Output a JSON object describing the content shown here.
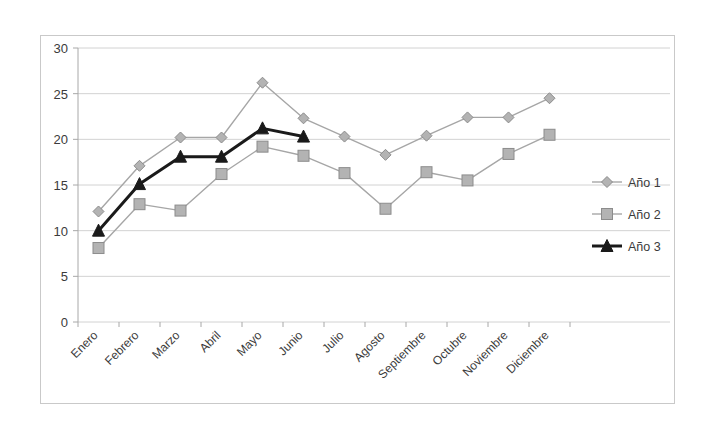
{
  "chart_data": {
    "type": "line",
    "title": "",
    "subtitle": "",
    "xlabel": "",
    "ylabel": "",
    "categories": [
      "Enero",
      "Febrero",
      "Marzo",
      "Abril",
      "Mayo",
      "Junio",
      "Julio",
      "Agosto",
      "Septiembre",
      "Octubre",
      "Noviembre",
      "Diciembre"
    ],
    "series": [
      {
        "name": "Año 1",
        "marker": "diamond",
        "color": "#a6a6a6",
        "values": [
          12.1,
          17.1,
          20.2,
          20.2,
          26.2,
          22.3,
          20.3,
          18.3,
          20.4,
          22.4,
          22.4,
          24.5
        ]
      },
      {
        "name": "Año 2",
        "marker": "square",
        "color": "#a6a6a6",
        "values": [
          8.1,
          12.9,
          12.2,
          16.2,
          19.2,
          18.2,
          16.3,
          12.4,
          16.4,
          15.5,
          18.4,
          20.5
        ]
      },
      {
        "name": "Año 3",
        "marker": "triangle",
        "color": "#1a1a1a",
        "values": [
          10.0,
          15.1,
          18.1,
          18.1,
          21.2,
          20.3,
          null,
          null,
          null,
          null,
          null,
          null
        ]
      }
    ],
    "ylim": [
      0,
      30
    ],
    "yticks": [
      0,
      5,
      10,
      15,
      20,
      25,
      30
    ],
    "ytick_labels": [
      "0",
      "5",
      "10",
      "15",
      "20",
      "25",
      "30"
    ],
    "grid": true,
    "legend_position": "right",
    "category_label_rotation": -45
  },
  "legend": {
    "entries": [
      {
        "label": "Año 1"
      },
      {
        "label": "Año 2"
      },
      {
        "label": "Año 3"
      }
    ]
  },
  "colors": {
    "series1": "#a6a6a6",
    "series2": "#a6a6a6",
    "series3": "#1a1a1a",
    "grid": "#d2d2d2",
    "axis": "#a8a8a8",
    "frame": "#c9c9c9",
    "text": "#3b3b3b",
    "marker_fill": "#b3b3b3",
    "background": "#ffffff"
  }
}
